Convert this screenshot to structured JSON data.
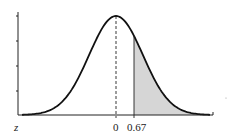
{
  "chart_data": {
    "type": "area",
    "title": "",
    "xlabel": "z",
    "ylabel": "",
    "x_tick_labels": [
      "0",
      "0.67"
    ],
    "x_ticks": [
      0,
      0.67
    ],
    "y_ticks_count": 4,
    "y_tick_labels": [],
    "xlim": [
      -3.5,
      3.5
    ],
    "mean": 0,
    "sd": 1,
    "shaded_region": {
      "from": 0.67,
      "to": "inf",
      "side": "right"
    },
    "dashed_line_at": 0,
    "solid_line_at": 0.67,
    "grid": false,
    "legend": null
  },
  "labels": {
    "axis_variable": "z",
    "mean_label": "0",
    "cutoff_label": "0.67"
  },
  "colors": {
    "curve": "#111111",
    "shade": "#d6d6d6",
    "axis": "#222222"
  }
}
